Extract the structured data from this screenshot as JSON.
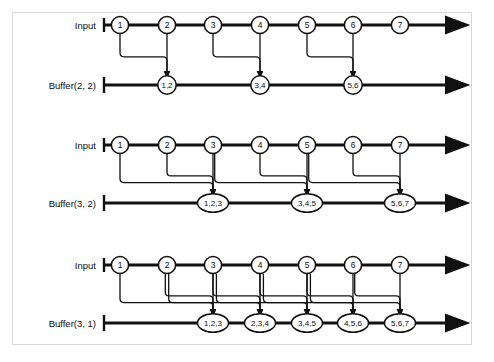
{
  "figure": {
    "type": "diagram",
    "colors": {
      "line": "#111111",
      "node_fill": "#ffffff",
      "node_stroke": "#111111",
      "frame": "#d8d8d8",
      "background": "#ffffff"
    },
    "geometry": {
      "node_x": [
        120,
        167,
        213,
        260,
        307,
        353,
        400
      ],
      "axis_start_x": 104,
      "axis_end_x": 448,
      "input_rows_y": [
        25,
        145,
        265
      ],
      "buffer_rows_y": [
        85,
        203,
        323
      ]
    }
  },
  "panels": [
    {
      "id": "panel-1",
      "input_label": "Input",
      "buffer_label": "Buffer(2, 2)",
      "input_nodes": [
        "1",
        "2",
        "3",
        "4",
        "5",
        "6",
        "7"
      ],
      "buffer_nodes": [
        {
          "label": "1,2",
          "slot": 2,
          "sources": [
            1,
            2
          ]
        },
        {
          "label": "3,4",
          "slot": 4,
          "sources": [
            3,
            4
          ]
        },
        {
          "label": "5,6",
          "slot": 6,
          "sources": [
            5,
            6
          ]
        }
      ]
    },
    {
      "id": "panel-2",
      "input_label": "Input",
      "buffer_label": "Buffer(3, 2)",
      "input_nodes": [
        "1",
        "2",
        "3",
        "4",
        "5",
        "6",
        "7"
      ],
      "buffer_nodes": [
        {
          "label": "1,2,3",
          "slot": 3,
          "sources": [
            1,
            2,
            3
          ]
        },
        {
          "label": "3,4,5",
          "slot": 5,
          "sources": [
            3,
            4,
            5
          ]
        },
        {
          "label": "5,6,7",
          "slot": 7,
          "sources": [
            5,
            6,
            7
          ]
        }
      ]
    },
    {
      "id": "panel-3",
      "input_label": "Input",
      "buffer_label": "Buffer(3, 1)",
      "input_nodes": [
        "1",
        "2",
        "3",
        "4",
        "5",
        "6",
        "7"
      ],
      "buffer_nodes": [
        {
          "label": "1,2,3",
          "slot": 3,
          "sources": [
            1,
            2,
            3
          ]
        },
        {
          "label": "2,3,4",
          "slot": 4,
          "sources": [
            2,
            3,
            4
          ]
        },
        {
          "label": "3,4,5",
          "slot": 5,
          "sources": [
            3,
            4,
            5
          ]
        },
        {
          "label": "4,5,6",
          "slot": 6,
          "sources": [
            4,
            5,
            6
          ]
        },
        {
          "label": "5,6,7",
          "slot": 7,
          "sources": [
            5,
            6,
            7
          ]
        }
      ]
    }
  ]
}
